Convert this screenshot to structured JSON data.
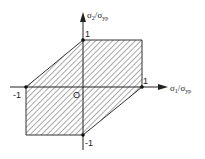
{
  "diagram": {
    "type": "yield-locus",
    "axes": {
      "x_label": {
        "sym": "σ",
        "sub": "1",
        "sep": "/",
        "den": "σ",
        "den_sub": "yp"
      },
      "y_label": {
        "sym": "σ",
        "sub": "2",
        "sep": "/",
        "den": "σ",
        "den_sub": "yp"
      }
    },
    "ticks": {
      "x_pos": "1",
      "x_neg": "-1",
      "y_pos": "1",
      "y_neg": "-1",
      "origin": "O"
    },
    "region": {
      "vertices": [
        [
          -1,
          0
        ],
        [
          0,
          1
        ],
        [
          1,
          1
        ],
        [
          1,
          0
        ],
        [
          0,
          -1
        ],
        [
          -1,
          -1
        ]
      ],
      "fill": "hatched",
      "stroke_color": "#333333"
    }
  }
}
